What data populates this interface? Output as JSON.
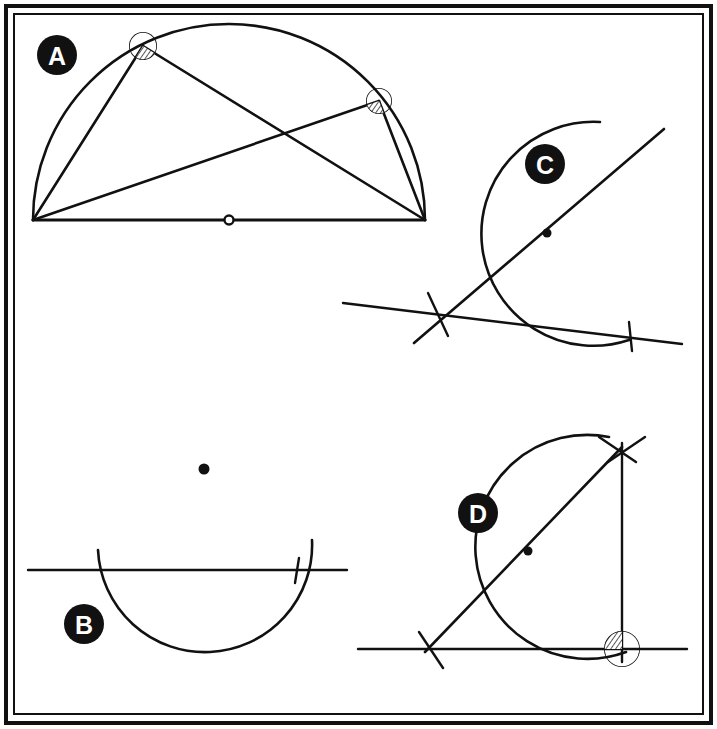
{
  "figure": {
    "width": 717,
    "height": 729,
    "background_color": "#ffffff",
    "ink_color": "#111111",
    "border": {
      "outer_color": "#111111",
      "inner_color": "#111111",
      "outer_rect": [
        6,
        6,
        705,
        717
      ],
      "inner_rect": [
        14,
        14,
        689,
        700
      ],
      "outer_stroke_width": 4,
      "inner_stroke_width": 2
    }
  },
  "panels": [
    {
      "id": "A",
      "label": "A",
      "badge": {
        "cx": 57,
        "cy": 55,
        "r": 20,
        "fill": "#111111",
        "text_color": "#ffffff"
      },
      "caption": "Semicircle with two inscribed right angles on a common diameter",
      "geometry": {
        "type": "thales-semicircle",
        "diameter_endpoints": [
          [
            33,
            220
          ],
          [
            425,
            220
          ]
        ],
        "center": [
          229,
          220
        ],
        "center_marker": "hollow-circle",
        "center_marker_radius": 4,
        "baseline": [
          [
            33,
            220
          ],
          [
            425,
            220
          ]
        ],
        "arc": {
          "from": [
            33,
            220
          ],
          "to": [
            425,
            220
          ],
          "rx": 196,
          "ry": 196,
          "sweep": 1
        },
        "inscribed_points": [
          [
            143,
            46
          ],
          [
            379,
            101
          ]
        ],
        "chords": [
          [
            [
              33,
              220
            ],
            [
              143,
              46
            ]
          ],
          [
            [
              143,
              46
            ],
            [
              425,
              220
            ]
          ],
          [
            [
              33,
              220
            ],
            [
              379,
              101
            ]
          ],
          [
            [
              379,
              101
            ],
            [
              425,
              220
            ]
          ]
        ],
        "angle_markers": [
          {
            "at": [
              143,
              46
            ],
            "style": "hatched-sector",
            "radius": 14
          },
          {
            "at": [
              379,
              101
            ],
            "style": "hatched-sector",
            "radius": 13
          }
        ]
      }
    },
    {
      "id": "B",
      "label": "B",
      "badge": {
        "cx": 84,
        "cy": 624,
        "r": 20,
        "fill": "#111111",
        "text_color": "#ffffff"
      },
      "caption": "Step 1: a point and a line, with a compass arc struck from the point crossing the line",
      "geometry": {
        "type": "compass-arc-step",
        "point": [
          204,
          469
        ],
        "point_marker": "filled-dot",
        "point_marker_radius": 5,
        "line": [
          [
            28,
            570
          ],
          [
            347,
            570
          ]
        ],
        "arc": {
          "from": [
            98,
            550
          ],
          "to": [
            312,
            540
          ],
          "rx": 106,
          "ry": 106,
          "sweep": 1,
          "large_arc": 1
        },
        "tick_marks": [
          {
            "at": [
              297,
              570
            ],
            "angle_deg": 80,
            "length": 22
          }
        ]
      }
    },
    {
      "id": "C",
      "label": "C",
      "badge": {
        "cx": 545,
        "cy": 164,
        "r": 20,
        "fill": "#111111",
        "text_color": "#ffffff"
      },
      "caption": "Step 2: the two crossing points joined through the centre to give a transversal line",
      "geometry": {
        "type": "compass-arc-step",
        "point": [
          547,
          233
        ],
        "point_marker": "filled-dot",
        "point_marker_radius": 4,
        "line": [
          [
            343,
            303
          ],
          [
            682,
            344
          ]
        ],
        "arc": {
          "from": [
            600,
            122
          ],
          "to": [
            629,
            340
          ],
          "rx": 112,
          "ry": 112,
          "sweep": 1,
          "large_arc": 1
        },
        "transversal": [
          [
            414,
            343
          ],
          [
            664,
            129
          ]
        ],
        "tick_marks": [
          {
            "at": [
              438,
              314
            ],
            "angle_deg": 65,
            "length": 26
          },
          {
            "at": [
              630,
              337
            ],
            "angle_deg": 85,
            "length": 24
          }
        ]
      }
    },
    {
      "id": "D",
      "label": "D",
      "badge": {
        "cx": 478,
        "cy": 513,
        "r": 20,
        "fill": "#111111",
        "text_color": "#ffffff"
      },
      "caption": "Step 3: the perpendicular dropped to the line, the right angle marked",
      "geometry": {
        "type": "perpendicular-construction",
        "point": [
          528,
          551
        ],
        "point_marker": "filled-dot",
        "point_marker_radius": 4,
        "line": [
          [
            358,
            649
          ],
          [
            687,
            649
          ]
        ],
        "arc": {
          "from": [
            609,
            437
          ],
          "to": [
            626,
            652
          ],
          "rx": 112,
          "ry": 112,
          "sweep": 1,
          "large_arc": 1
        },
        "transversal": [
          [
            425,
            652
          ],
          [
            622,
            447
          ]
        ],
        "perpendicular": [
          [
            622,
            443
          ],
          [
            622,
            662
          ]
        ],
        "tick_marks": [
          {
            "at": [
              432,
              648
            ],
            "angle_deg": 62,
            "length": 26
          },
          {
            "at": [
              622,
              452
            ],
            "angle_deg": 60,
            "length": 26
          },
          {
            "at": [
              622,
              452
            ],
            "angle_deg": 120,
            "length": 26
          }
        ],
        "angle_markers": [
          {
            "at": [
              622,
              649
            ],
            "style": "hatched-quadrant",
            "radius": 18,
            "label": "right-angle"
          }
        ]
      }
    }
  ]
}
